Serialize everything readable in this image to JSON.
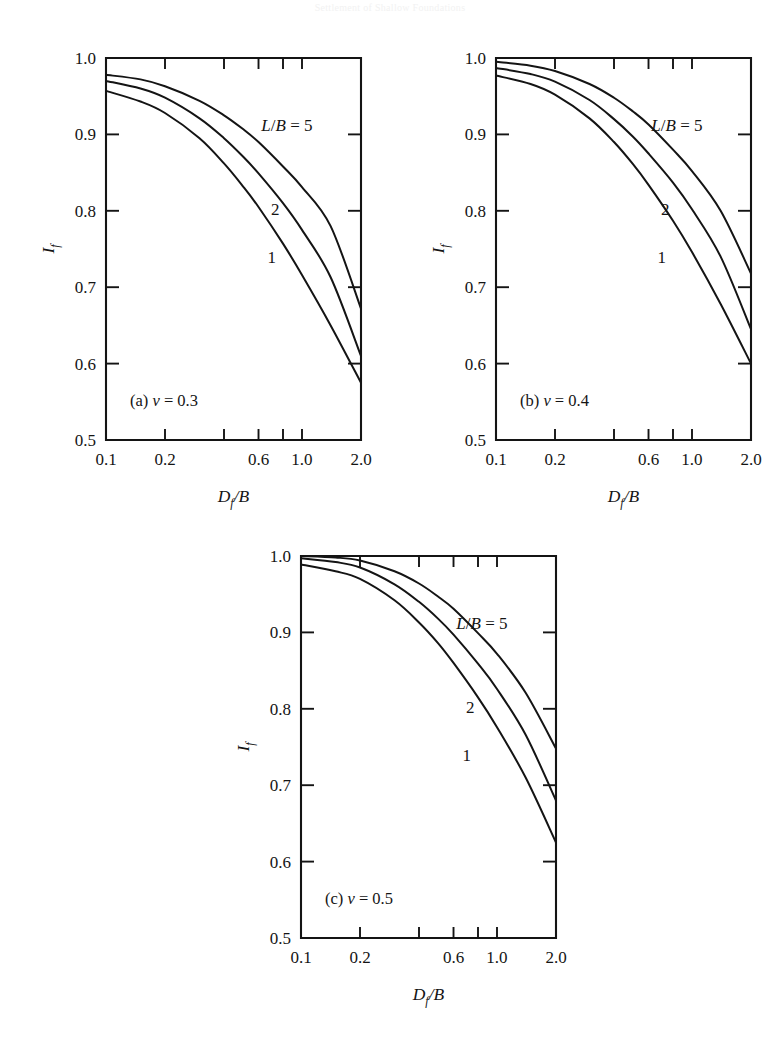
{
  "figure": {
    "running_header": "Settlement of Shallow Foundations",
    "background_color": "#ffffff",
    "ink_color": "#141414"
  },
  "chart_data": [
    {
      "type": "line",
      "panel_id": "a",
      "caption": "(a) ν = 0.3",
      "caption_prefix": "(a)",
      "caption_symbol": "ν",
      "caption_value": "= 0.3",
      "poisson_ratio": 0.3,
      "title": "",
      "xlabel": "D_f/B",
      "xlabel_main": "D",
      "xlabel_sub": "f",
      "xlabel_rest": "/B",
      "ylabel": "I_f",
      "ylabel_main": "I",
      "ylabel_sub": "f",
      "xscale": "log",
      "xlim": [
        0.1,
        2.0
      ],
      "ylim": [
        0.5,
        1.0
      ],
      "grid": false,
      "legend_position": "inline-curve-labels",
      "xticks": [
        0.1,
        0.2,
        0.4,
        0.6,
        0.8,
        1.0,
        2.0
      ],
      "xtick_labels": [
        "0.1",
        "0.2",
        "",
        "0.6",
        "",
        "1.0",
        "2.0"
      ],
      "yticks": [
        0.5,
        0.6,
        0.7,
        0.8,
        0.9,
        1.0
      ],
      "ytick_labels": [
        "0.5",
        "0.6",
        "0.7",
        "0.8",
        "0.9",
        "1.0"
      ],
      "x": [
        0.1,
        0.15,
        0.2,
        0.3,
        0.4,
        0.5,
        0.6,
        0.8,
        1.0,
        1.4,
        2.0
      ],
      "series": [
        {
          "name": "L/B = 5",
          "label": "L/B = 5",
          "values": [
            0.978,
            0.972,
            0.963,
            0.944,
            0.925,
            0.907,
            0.89,
            0.858,
            0.831,
            0.78,
            0.672
          ]
        },
        {
          "name": "2",
          "label": "2",
          "values": [
            0.97,
            0.96,
            0.948,
            0.921,
            0.895,
            0.871,
            0.849,
            0.81,
            0.775,
            0.713,
            0.61
          ]
        },
        {
          "name": "1",
          "label": "1",
          "values": [
            0.957,
            0.943,
            0.928,
            0.895,
            0.862,
            0.832,
            0.805,
            0.757,
            0.716,
            0.65,
            0.575
          ]
        }
      ]
    },
    {
      "type": "line",
      "panel_id": "b",
      "caption": "(b) ν = 0.4",
      "caption_prefix": "(b)",
      "caption_symbol": "ν",
      "caption_value": "= 0.4",
      "poisson_ratio": 0.4,
      "title": "",
      "xlabel": "D_f/B",
      "xlabel_main": "D",
      "xlabel_sub": "f",
      "xlabel_rest": "/B",
      "ylabel": "I_f",
      "ylabel_main": "I",
      "ylabel_sub": "f",
      "xscale": "log",
      "xlim": [
        0.1,
        2.0
      ],
      "ylim": [
        0.5,
        1.0
      ],
      "grid": false,
      "legend_position": "inline-curve-labels",
      "xticks": [
        0.1,
        0.2,
        0.4,
        0.6,
        0.8,
        1.0,
        2.0
      ],
      "xtick_labels": [
        "0.1",
        "0.2",
        "",
        "0.6",
        "",
        "1.0",
        "2.0"
      ],
      "yticks": [
        0.5,
        0.6,
        0.7,
        0.8,
        0.9,
        1.0
      ],
      "ytick_labels": [
        "0.5",
        "0.6",
        "0.7",
        "0.8",
        "0.9",
        "1.0"
      ],
      "x": [
        0.1,
        0.15,
        0.2,
        0.3,
        0.4,
        0.5,
        0.6,
        0.8,
        1.0,
        1.4,
        2.0
      ],
      "series": [
        {
          "name": "L/B = 5",
          "label": "L/B = 5",
          "values": [
            0.995,
            0.99,
            0.983,
            0.966,
            0.948,
            0.93,
            0.913,
            0.88,
            0.852,
            0.8,
            0.718
          ]
        },
        {
          "name": "2",
          "label": "2",
          "values": [
            0.987,
            0.979,
            0.969,
            0.945,
            0.92,
            0.897,
            0.875,
            0.837,
            0.802,
            0.74,
            0.645
          ]
        },
        {
          "name": "1",
          "label": "1",
          "values": [
            0.977,
            0.966,
            0.952,
            0.921,
            0.89,
            0.861,
            0.834,
            0.787,
            0.746,
            0.678,
            0.6
          ]
        }
      ]
    },
    {
      "type": "line",
      "panel_id": "c",
      "caption": "(c) ν = 0.5",
      "caption_prefix": "(c)",
      "caption_symbol": "ν",
      "caption_value": "= 0.5",
      "poisson_ratio": 0.5,
      "title": "",
      "xlabel": "D_f/B",
      "xlabel_main": "D",
      "xlabel_sub": "f",
      "xlabel_rest": "/B",
      "ylabel": "I_f",
      "ylabel_main": "I",
      "ylabel_sub": "f",
      "xscale": "log",
      "xlim": [
        0.1,
        2.0
      ],
      "ylim": [
        0.5,
        1.0
      ],
      "grid": false,
      "legend_position": "inline-curve-labels",
      "xticks": [
        0.1,
        0.2,
        0.4,
        0.6,
        0.8,
        1.0,
        2.0
      ],
      "xtick_labels": [
        "0.1",
        "0.2",
        "",
        "0.6",
        "",
        "1.0",
        "2.0"
      ],
      "yticks": [
        0.5,
        0.6,
        0.7,
        0.8,
        0.9,
        1.0
      ],
      "ytick_labels": [
        "0.5",
        "0.6",
        "0.7",
        "0.8",
        "0.9",
        "1.0"
      ],
      "x": [
        0.1,
        0.15,
        0.2,
        0.3,
        0.4,
        0.5,
        0.6,
        0.8,
        1.0,
        1.4,
        2.0
      ],
      "series": [
        {
          "name": "L/B = 5",
          "label": "L/B = 5",
          "values": [
            1.0,
            0.998,
            0.994,
            0.98,
            0.964,
            0.947,
            0.931,
            0.899,
            0.872,
            0.821,
            0.748
          ]
        },
        {
          "name": "2",
          "label": "2",
          "values": [
            0.997,
            0.992,
            0.985,
            0.963,
            0.94,
            0.918,
            0.897,
            0.859,
            0.826,
            0.766,
            0.68
          ]
        },
        {
          "name": "1",
          "label": "1",
          "values": [
            0.989,
            0.98,
            0.97,
            0.942,
            0.913,
            0.886,
            0.86,
            0.815,
            0.776,
            0.71,
            0.625
          ]
        }
      ]
    }
  ]
}
